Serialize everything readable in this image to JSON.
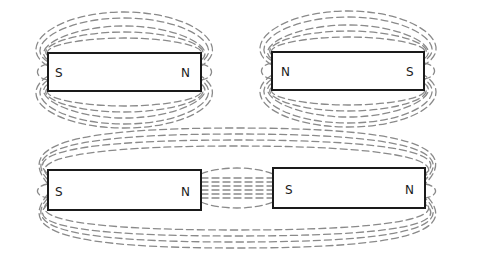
{
  "diagram": {
    "colors": {
      "magnet_outline": "#1a1a1a",
      "field_lines": "#8a8a8a",
      "background": "#ffffff"
    },
    "magnets": [
      {
        "id": "top-left",
        "left_pole": "S",
        "right_pole": "N"
      },
      {
        "id": "top-right",
        "left_pole": "N",
        "right_pole": "S"
      },
      {
        "id": "bottom-left",
        "left_pole": "S",
        "right_pole": "N"
      },
      {
        "id": "bottom-right",
        "left_pole": "S",
        "right_pole": "N"
      }
    ],
    "configurations": [
      {
        "name": "single-magnet-s-n",
        "magnets": [
          "top-left"
        ]
      },
      {
        "name": "single-magnet-n-s",
        "magnets": [
          "top-right"
        ]
      },
      {
        "name": "two-magnets-attracting",
        "magnets": [
          "bottom-left",
          "bottom-right"
        ]
      }
    ]
  }
}
